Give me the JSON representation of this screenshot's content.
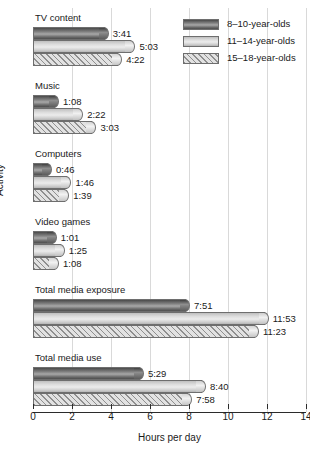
{
  "chart_data": {
    "type": "bar",
    "orientation": "horizontal",
    "title": "",
    "xlabel": "Hours per day",
    "ylabel": "Activity",
    "xlim": [
      0,
      14
    ],
    "xticks": [
      0,
      2,
      4,
      6,
      8,
      10,
      12,
      14
    ],
    "xtick_labels": [
      "0",
      "2",
      "4",
      "6",
      "8",
      "10",
      "12",
      "14"
    ],
    "grid": true,
    "grid_axis": "x",
    "legend_position": "top-right",
    "value_format": "h:mm",
    "categories": [
      "TV content",
      "Music",
      "Computers",
      "Video games",
      "Total media exposure",
      "Total media use"
    ],
    "series": [
      {
        "name": "8–10-year-olds",
        "fill": "dark-gradient",
        "color": "#7d7d7d",
        "labels": [
          "3:41",
          "1:08",
          "0:46",
          "1:01",
          "7:51",
          "5:29"
        ],
        "values": [
          3.683,
          1.133,
          0.767,
          1.017,
          7.85,
          5.483
        ]
      },
      {
        "name": "11–14-year-olds",
        "fill": "light-gradient",
        "color": "#dcdcdc",
        "labels": [
          "5:03",
          "2:22",
          "1:46",
          "1:25",
          "11:53",
          "8:40"
        ],
        "values": [
          5.05,
          2.367,
          1.767,
          1.417,
          11.883,
          8.667
        ]
      },
      {
        "name": "15–18-year-olds",
        "fill": "diagonal-hatch",
        "color": "#cfcfcf",
        "labels": [
          "4:22",
          "3:03",
          "1:39",
          "1:08",
          "11:23",
          "7:58"
        ],
        "values": [
          4.367,
          3.05,
          1.65,
          1.133,
          11.383,
          7.967
        ]
      }
    ]
  }
}
